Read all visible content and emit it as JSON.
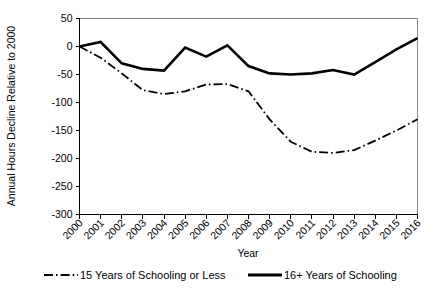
{
  "chart_data": {
    "type": "line",
    "title": "",
    "xlabel": "Year",
    "ylabel": "Annual Hours Decline Relative to 2000",
    "categories": [
      "2000",
      "2001",
      "2002",
      "2003",
      "2004",
      "2005",
      "2006",
      "2007",
      "2008",
      "2009",
      "2010",
      "2011",
      "2012",
      "2013",
      "2014",
      "2015",
      "2016"
    ],
    "xlim": [
      2000,
      2016
    ],
    "ylim": [
      -300,
      50
    ],
    "yticks": [
      50,
      0,
      -50,
      -100,
      -150,
      -200,
      -250,
      -300
    ],
    "ytick_labels": [
      "50",
      "0",
      "-50",
      "-100",
      "-150",
      "-200",
      "-250",
      "-300"
    ],
    "grid": false,
    "legend_position": "bottom",
    "series": [
      {
        "name": "15 Years of Schooling or Less",
        "style": "dash-dot",
        "color": "#000000",
        "values": [
          0,
          -20,
          -48,
          -78,
          -85,
          -80,
          -68,
          -67,
          -80,
          -130,
          -170,
          -188,
          -190,
          -185,
          -168,
          -150,
          -130
        ]
      },
      {
        "name": "16+ Years of Schooling",
        "style": "solid",
        "color": "#000000",
        "values": [
          0,
          8,
          -30,
          -40,
          -43,
          -2,
          -18,
          2,
          -35,
          -48,
          -50,
          -48,
          -42,
          -50,
          -28,
          -5,
          15
        ]
      }
    ]
  },
  "legend": {
    "items": [
      {
        "label": "15 Years of Schooling or Less",
        "style": "dash-dot"
      },
      {
        "label": "16+ Years of Schooling",
        "style": "solid"
      }
    ]
  }
}
